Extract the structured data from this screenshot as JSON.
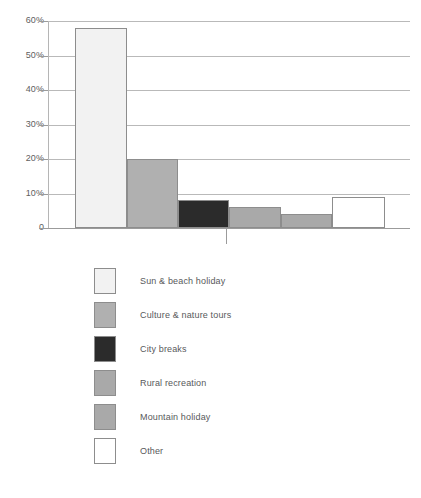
{
  "chart_data": {
    "type": "bar",
    "title": "",
    "subtitle": "",
    "xlabel": "",
    "ylabel": "",
    "categories": [
      "Sun & beach holiday",
      "Culture & nature tours",
      "City breaks",
      "Rural recreation",
      "Mountain holiday",
      "Other"
    ],
    "values": [
      58,
      20,
      8,
      6,
      4,
      9
    ],
    "value_suffix": "%",
    "ylim": [
      0,
      60
    ],
    "ytick_values": [
      60,
      50,
      40,
      30,
      20,
      10,
      0
    ],
    "ytick_labels": [
      "60%",
      "50%",
      "40%",
      "30%",
      "20%",
      "10%",
      "0"
    ],
    "grid": true,
    "grid_axis": "y",
    "legend_position": "below",
    "bar_colors": [
      "#f2f2f2",
      "#b0b0b0",
      "#2b2b2b",
      "#a9a9a9",
      "#a9a9a9",
      "#ffffff"
    ],
    "bar_border_color": "#8d8d8d",
    "gridline_color": "#b9b9b9",
    "axis_color": "#9b9b9b",
    "text_color": "#58595b"
  },
  "legend": {
    "items": [
      {
        "label": "Sun & beach holiday",
        "color": "#f2f2f2"
      },
      {
        "label": "Culture & nature tours",
        "color": "#b0b0b0"
      },
      {
        "label": "City breaks",
        "color": "#2b2b2b"
      },
      {
        "label": "Rural recreation",
        "color": "#a9a9a9"
      },
      {
        "label": "Mountain holiday",
        "color": "#a9a9a9"
      },
      {
        "label": "Other",
        "color": "#ffffff"
      }
    ]
  }
}
